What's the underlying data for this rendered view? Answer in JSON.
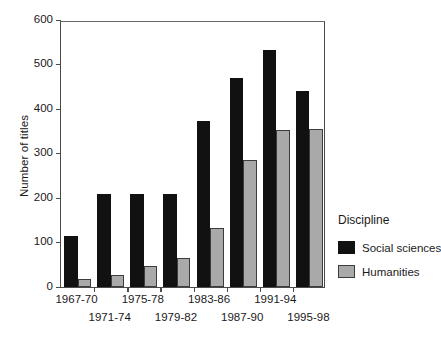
{
  "chart_data": {
    "type": "bar",
    "title": "",
    "xlabel": "",
    "ylabel": "Number of titles",
    "ylim": [
      0,
      600
    ],
    "yticks": [
      0,
      100,
      200,
      300,
      400,
      500,
      600
    ],
    "ytick_labels": [
      "0",
      "100",
      "200",
      "300",
      "400",
      "500",
      "600"
    ],
    "grid": false,
    "legend_position": "right",
    "legend_title": "Discipline",
    "categories": [
      "1967-70",
      "1971-74",
      "1975-78",
      "1979-82",
      "1983-86",
      "1987-90",
      "1991-94",
      "1995-98"
    ],
    "series": [
      {
        "name": "Social sciences",
        "color": "#111111",
        "values": [
          115,
          208,
          208,
          208,
          373,
          470,
          533,
          440
        ]
      },
      {
        "name": "Humanities",
        "color": "#a9a9a9",
        "values": [
          18,
          28,
          48,
          65,
          133,
          285,
          353,
          355
        ]
      }
    ]
  },
  "axes": {
    "frame_color": "#4a4a4a"
  }
}
